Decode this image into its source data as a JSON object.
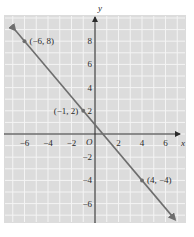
{
  "chart_data": {
    "type": "line",
    "title": "",
    "xlabel": "x",
    "ylabel": "y",
    "origin_label": "O",
    "xlim": [
      -7.5,
      7.5
    ],
    "ylim": [
      -7.5,
      9.5
    ],
    "grid": true,
    "x_ticks": [
      -6,
      -4,
      -2,
      2,
      4,
      6
    ],
    "x_tick_labels": [
      "−6",
      "−4",
      "−2",
      "2",
      "4",
      "6"
    ],
    "y_ticks": [
      8,
      6,
      4,
      2,
      -2,
      -4,
      -6
    ],
    "y_tick_labels": [
      "8",
      "6",
      "4",
      "2",
      "−2",
      "−4",
      "−6"
    ],
    "series": [
      {
        "name": "line",
        "equation": "y = -6/5 x + 4/5",
        "x": [
          -6,
          -1,
          4
        ],
        "y": [
          8,
          2,
          -4
        ],
        "arrows": "both",
        "color": "#6e6e6e"
      }
    ],
    "points": [
      {
        "x": -6,
        "y": 8,
        "label": "(−6, 8)"
      },
      {
        "x": -1,
        "y": 2,
        "label": "(−1, 2)"
      },
      {
        "x": 4,
        "y": -4,
        "label": "(4, −4)"
      }
    ],
    "colors": {
      "background": "#dcdcdc",
      "grid": "#f4f4f4",
      "axis": "#2a2a2a",
      "line": "#6e6e6e"
    }
  }
}
